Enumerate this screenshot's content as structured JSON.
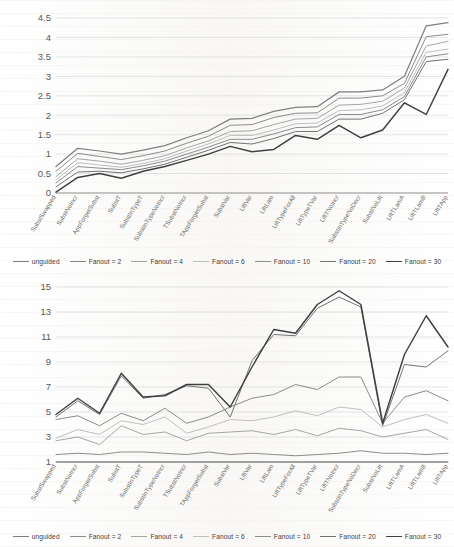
{
  "figure": {
    "title": "",
    "background_color": "#ffffff"
  },
  "legend": {
    "position": "bottom",
    "entries": [
      {
        "label": "unguided",
        "color": "#7f7f7f",
        "width": 1.25
      },
      {
        "label": "Fanout = 2",
        "color": "#8c8c8c",
        "width": 1.0
      },
      {
        "label": "Fanout = 4",
        "color": "#a6a6a6",
        "width": 1.0
      },
      {
        "label": "Fanout = 6",
        "color": "#bfbfbf",
        "width": 1.0
      },
      {
        "label": "Fanout = 10",
        "color": "#8c8c8c",
        "width": 1.0
      },
      {
        "label": "Fanout = 20",
        "color": "#737373",
        "width": 1.0
      },
      {
        "label": "Fanout = 30",
        "color": "#404040",
        "width": 1.45
      }
    ]
  },
  "categories": [
    "SubstSwapped",
    "SubstNoIncr",
    "AppForgetSubst",
    "SubstT",
    "SubstInTypeT",
    "SubstInTypeNoIncr",
    "TSubstNoIncr",
    "TAppForgetSubst",
    "SubstVar",
    "LiftVar",
    "LiftLam",
    "LiftTypeForAll",
    "LiftTypeTVar",
    "LiftTNoIncr",
    "SubstInTypeNoDecr",
    "SubstNoLift",
    "LiftTLamA",
    "LiftTLamB",
    "LiftTApp"
  ],
  "chart_data": [
    {
      "id": "top",
      "type": "line",
      "title": "",
      "xlabel": "",
      "ylabel": "",
      "ylim": [
        0,
        4.5
      ],
      "yticks": [
        0,
        0.5,
        1,
        1.5,
        2,
        2.5,
        3,
        3.5,
        4,
        4.5
      ],
      "ytick_labels": [
        "0",
        "0.5",
        "1",
        "1.5",
        "2",
        "2.5",
        "3",
        "3.5",
        "4",
        "4.5"
      ],
      "grid": true,
      "categories": [
        "SubstSwapped",
        "SubstNoIncr",
        "AppForgetSubst",
        "SubstT",
        "SubstInTypeT",
        "SubstInTypeNoIncr",
        "TSubstNoIncr",
        "TAppForgetSubst",
        "SubstVar",
        "LiftVar",
        "LiftLam",
        "LiftTypeForAll",
        "LiftTypeTVar",
        "LiftTNoIncr",
        "SubstInTypeNoDecr",
        "SubstNoLift",
        "LiftTLamA",
        "LiftTLamB",
        "LiftTApp"
      ],
      "series": [
        {
          "name": "unguided",
          "color": "#7f7f7f",
          "width": 1.25,
          "values": [
            0.68,
            1.15,
            1.08,
            1.0,
            1.1,
            1.22,
            1.42,
            1.6,
            1.9,
            1.92,
            2.1,
            2.2,
            2.22,
            2.6,
            2.6,
            2.65,
            3.0,
            4.3,
            4.38
          ]
        },
        {
          "name": "Fanout = 2",
          "color": "#8c8c8c",
          "width": 1.0,
          "values": [
            0.56,
            1.02,
            0.94,
            0.86,
            0.96,
            1.08,
            1.28,
            1.46,
            1.74,
            1.76,
            1.94,
            2.05,
            2.06,
            2.44,
            2.44,
            2.5,
            2.82,
            4.02,
            4.08
          ]
        },
        {
          "name": "Fanout = 4",
          "color": "#a6a6a6",
          "width": 1.0,
          "values": [
            0.42,
            0.88,
            0.82,
            0.74,
            0.84,
            0.96,
            1.16,
            1.34,
            1.58,
            1.6,
            1.76,
            1.9,
            1.92,
            2.26,
            2.28,
            2.36,
            2.7,
            3.78,
            3.9
          ]
        },
        {
          "name": "Fanout = 6",
          "color": "#bfbfbf",
          "width": 1.0,
          "values": [
            0.34,
            0.78,
            0.72,
            0.66,
            0.76,
            0.88,
            1.08,
            1.26,
            1.48,
            1.48,
            1.62,
            1.78,
            1.8,
            2.12,
            2.14,
            2.24,
            2.58,
            3.62,
            3.7
          ]
        },
        {
          "name": "Fanout = 10",
          "color": "#8c8c8c",
          "width": 1.0,
          "values": [
            0.26,
            0.68,
            0.64,
            0.6,
            0.7,
            0.82,
            1.0,
            1.18,
            1.38,
            1.38,
            1.52,
            1.68,
            1.7,
            2.02,
            2.02,
            2.14,
            2.48,
            3.5,
            3.58
          ]
        },
        {
          "name": "Fanout = 20",
          "color": "#737373",
          "width": 1.0,
          "values": [
            0.16,
            0.54,
            0.56,
            0.52,
            0.62,
            0.74,
            0.92,
            1.1,
            1.3,
            1.26,
            1.4,
            1.58,
            1.58,
            1.9,
            1.9,
            2.05,
            2.4,
            3.38,
            3.44
          ]
        },
        {
          "name": "Fanout = 30",
          "color": "#404040",
          "width": 1.45,
          "values": [
            0.02,
            0.4,
            0.5,
            0.38,
            0.56,
            0.68,
            0.84,
            1.0,
            1.2,
            1.06,
            1.12,
            1.48,
            1.38,
            1.74,
            1.42,
            1.62,
            2.32,
            2.02,
            3.18,
            3.28
          ]
        }
      ]
    },
    {
      "id": "bottom",
      "type": "line",
      "title": "",
      "xlabel": "",
      "ylabel": "",
      "ylim": [
        1,
        15
      ],
      "yticks": [
        1,
        3,
        5,
        7,
        9,
        11,
        13,
        15
      ],
      "ytick_labels": [
        "1",
        "3",
        "5",
        "7",
        "9",
        "11",
        "13",
        "15"
      ],
      "grid": true,
      "categories": [
        "SubstSwapped",
        "SubstNoIncr",
        "AppForgetSubst",
        "SubstT",
        "SubstInTypeT",
        "SubstInTypeNoIncr",
        "TSubstNoIncr",
        "TAppForgetSubst",
        "SubstVar",
        "LiftVar",
        "LiftLam",
        "LiftTypeForAll",
        "LiftTypeTVar",
        "LiftTNoIncr",
        "SubstInTypeNoDecr",
        "SubstNoLift",
        "LiftTLamA",
        "LiftTLamB",
        "LiftTApp"
      ],
      "series": [
        {
          "name": "unguided",
          "color": "#7f7f7f",
          "width": 1.1,
          "values": [
            1.0,
            1.0,
            1.0,
            1.0,
            1.0,
            1.0,
            1.0,
            1.0,
            1.0,
            1.0,
            1.0,
            1.0,
            1.0,
            1.0,
            1.0,
            1.0,
            1.0,
            1.0,
            1.0
          ]
        },
        {
          "name": "Fanout = 2",
          "color": "#8c8c8c",
          "width": 1.0,
          "values": [
            1.6,
            1.7,
            1.6,
            1.8,
            1.8,
            1.7,
            1.6,
            1.8,
            1.6,
            1.7,
            1.6,
            1.5,
            1.6,
            1.7,
            1.9,
            1.7,
            1.7,
            1.6,
            1.7
          ]
        },
        {
          "name": "Fanout = 4",
          "color": "#a6a6a6",
          "width": 1.0,
          "values": [
            2.7,
            3.0,
            2.4,
            3.9,
            3.2,
            3.4,
            2.7,
            3.3,
            3.4,
            3.5,
            3.2,
            3.6,
            3.1,
            3.7,
            3.5,
            3.0,
            3.3,
            3.6,
            2.8
          ]
        },
        {
          "name": "Fanout = 6",
          "color": "#bfbfbf",
          "width": 1.0,
          "values": [
            2.9,
            3.6,
            3.2,
            4.3,
            4.0,
            4.6,
            3.3,
            3.8,
            4.4,
            4.3,
            4.6,
            5.1,
            4.7,
            5.4,
            5.2,
            3.8,
            4.4,
            4.8,
            4.1
          ]
        },
        {
          "name": "Fanout = 10",
          "color": "#8c8c8c",
          "width": 1.0,
          "values": [
            4.4,
            4.7,
            3.9,
            4.9,
            4.3,
            5.3,
            4.1,
            4.6,
            5.4,
            6.1,
            6.4,
            7.2,
            6.8,
            7.8,
            7.8,
            4.1,
            6.2,
            6.7,
            5.9
          ]
        },
        {
          "name": "Fanout = 20",
          "color": "#737373",
          "width": 1.0,
          "values": [
            4.6,
            5.9,
            4.8,
            7.9,
            6.1,
            6.4,
            7.1,
            6.9,
            4.6,
            9.1,
            11.2,
            11.1,
            13.3,
            14.2,
            13.4,
            3.9,
            8.8,
            8.6,
            9.9
          ]
        },
        {
          "name": "Fanout = 30",
          "color": "#404040",
          "width": 1.45,
          "values": [
            4.8,
            6.1,
            4.9,
            8.1,
            6.2,
            6.3,
            7.2,
            7.2,
            5.4,
            8.6,
            11.6,
            11.3,
            13.6,
            14.7,
            13.6,
            4.1,
            9.6,
            12.7,
            10.2,
            12.5
          ]
        }
      ]
    }
  ]
}
